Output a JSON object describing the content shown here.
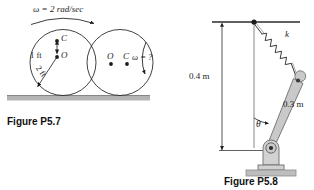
{
  "page": {
    "background": "#ffffff",
    "ink": "#1c1c1c",
    "width": 314,
    "height": 190
  },
  "figures": [
    {
      "id": "P5.7",
      "caption": "Figure P5.7",
      "description": "Two rolling disks on a horizontal surface with offset center of mass",
      "labels": {
        "omega_known": "ω = 2 rad/sec",
        "omega_unknown": "ω = ?",
        "dim_offset": "1 ft",
        "dim_radius": "2 ft",
        "point_c_left": "C",
        "point_o_left": "O",
        "point_o_right": "O",
        "point_c_right": "C"
      },
      "geometry": {
        "left_disk_center": [
          63,
          62
        ],
        "left_disk_radius": 33,
        "right_disk_center": [
          120,
          62
        ],
        "right_disk_radius": 33,
        "ground_y": 96,
        "ground_color": "#b4b4b4"
      }
    },
    {
      "id": "P5.8",
      "caption": "Figure P5.8",
      "description": "Pin-jointed bar with spring attached to an overhead support",
      "labels": {
        "spring_constant": "k",
        "dim_vertical": "0.4 m",
        "dim_bar": "0.3 m",
        "angle": "θ"
      },
      "geometry": {
        "ceiling_y": 22,
        "anchor_point": [
          254,
          22
        ],
        "pivot_point": [
          270,
          152
        ],
        "bar_top_point": [
          297,
          86
        ],
        "base_color": "#bdbdbd",
        "bar_fill": "#c9c9c9",
        "bar_stroke": "#6e6e6e"
      }
    }
  ]
}
